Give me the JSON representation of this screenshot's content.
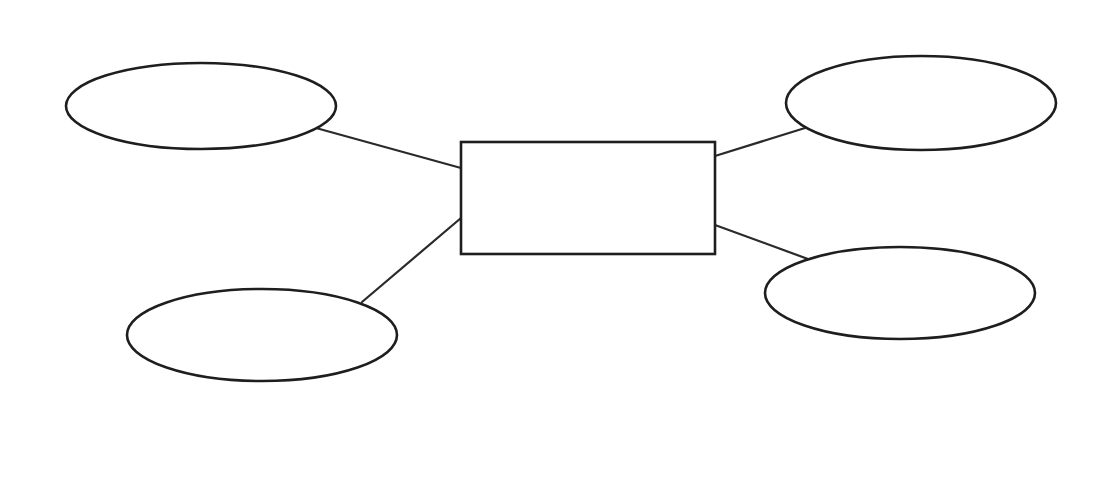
{
  "diagram": {
    "type": "entity-attribute (blank template)",
    "colors": {
      "stroke": "#1e1e1e",
      "fill": "#ffffff",
      "background": "#ffffff"
    },
    "center": {
      "shape": "rectangle",
      "label": "",
      "x": 461,
      "y": 142,
      "width": 254,
      "height": 112
    },
    "nodes": [
      {
        "id": "top-left",
        "shape": "ellipse",
        "label": "",
        "cx": 201,
        "cy": 106,
        "rx": 135,
        "ry": 43
      },
      {
        "id": "bottom-left",
        "shape": "ellipse",
        "label": "",
        "cx": 262,
        "cy": 335,
        "rx": 135,
        "ry": 46
      },
      {
        "id": "top-right",
        "shape": "ellipse",
        "label": "",
        "cx": 921,
        "cy": 103,
        "rx": 135,
        "ry": 47
      },
      {
        "id": "bottom-right",
        "shape": "ellipse",
        "label": "",
        "cx": 900,
        "cy": 293,
        "rx": 135,
        "ry": 46
      }
    ],
    "edges": [
      {
        "from": "top-left",
        "to": "center",
        "x1": 316,
        "y1": 128,
        "x2": 461,
        "y2": 168
      },
      {
        "from": "bottom-left",
        "to": "center",
        "x1": 362,
        "y1": 302,
        "x2": 461,
        "y2": 218
      },
      {
        "from": "top-right",
        "to": "center",
        "x1": 805,
        "y1": 128,
        "x2": 715,
        "y2": 156
      },
      {
        "from": "bottom-right",
        "to": "center",
        "x1": 808,
        "y1": 259,
        "x2": 715,
        "y2": 225
      }
    ]
  }
}
